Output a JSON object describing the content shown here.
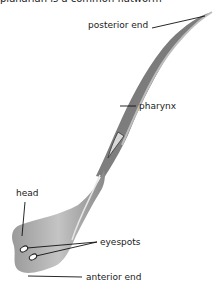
{
  "caption": "planarian is a common flatworm",
  "diagram": {
    "subject": "planarian",
    "labels": {
      "posterior_end": "posterior end",
      "pharynx": "pharynx",
      "head": "head",
      "eyespots": "eyespots",
      "anterior_end": "anterior end"
    },
    "colors": {
      "body_dark": "#7a7a7a",
      "body_light": "#b9b9b9",
      "leader_line": "#111111"
    }
  }
}
